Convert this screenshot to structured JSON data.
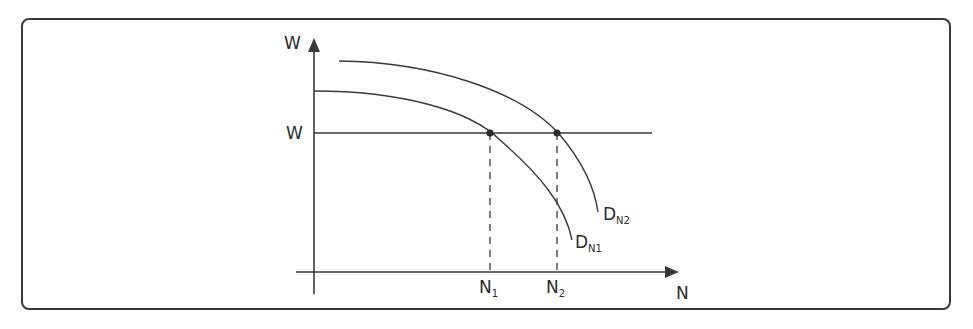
{
  "diagram": {
    "axes": {
      "y_label": "W",
      "x_label": "N"
    },
    "wage_line": {
      "label": "W"
    },
    "curves": [
      {
        "id": "dn1",
        "label_main": "D",
        "label_sub": "N1"
      },
      {
        "id": "dn2",
        "label_main": "D",
        "label_sub": "N2"
      }
    ],
    "points": [
      {
        "label_main": "N",
        "label_sub": "1"
      },
      {
        "label_main": "N",
        "label_sub": "2"
      }
    ],
    "colors": {
      "line": "#3a3a3a",
      "text": "#2b2b2b"
    }
  }
}
